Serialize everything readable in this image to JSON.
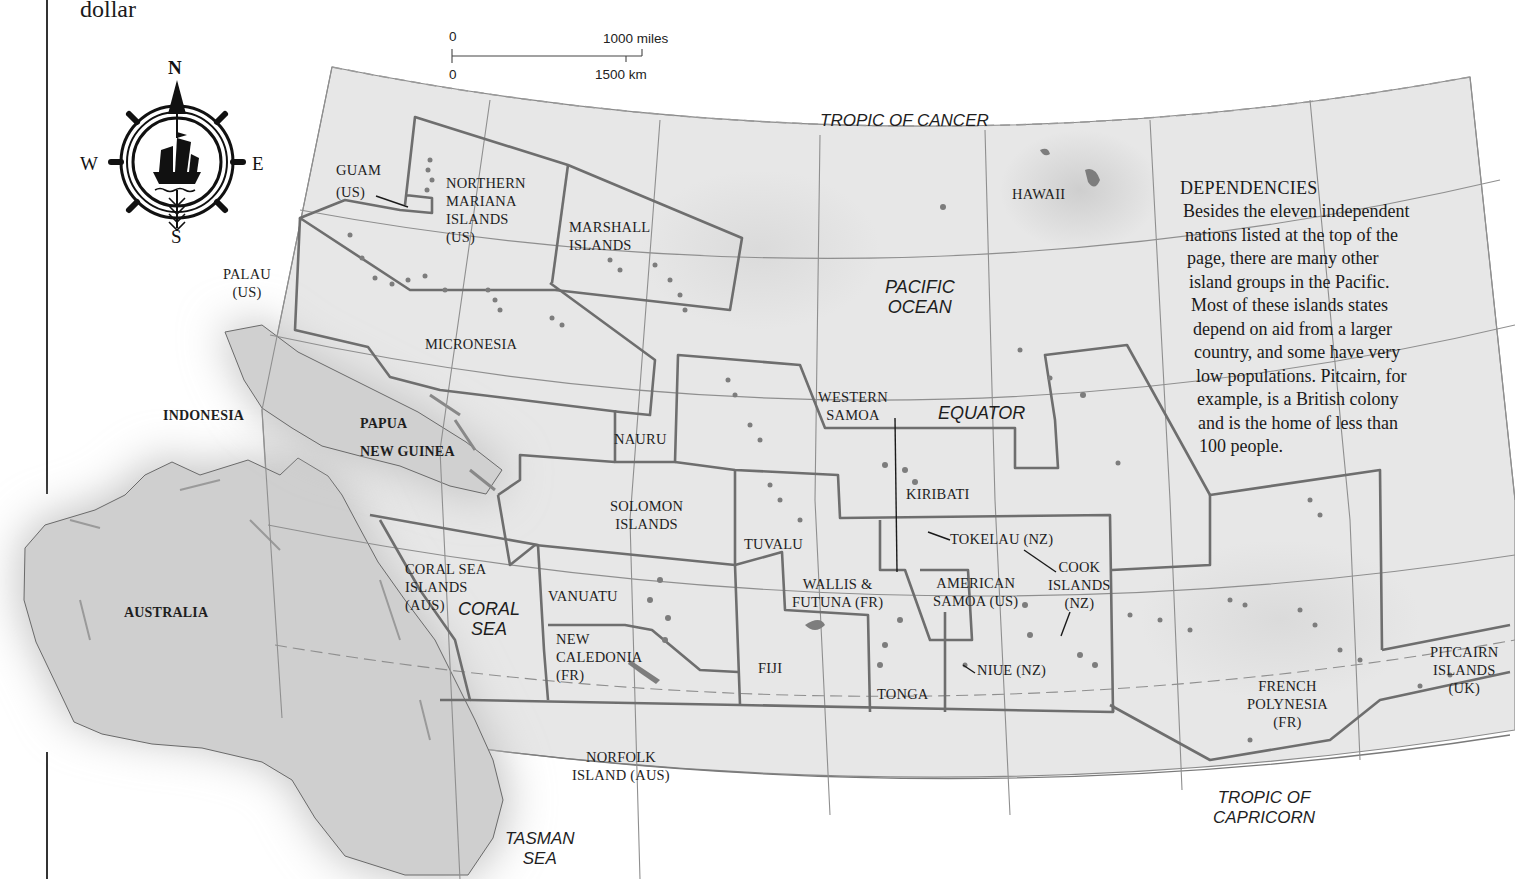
{
  "page": {
    "top_fragment": "dollar"
  },
  "scale_bar": {
    "miles_zero": "0",
    "miles_max": "1000 miles",
    "km_zero": "0",
    "km_max": "1500 km"
  },
  "compass": {
    "north": "N",
    "south": "S",
    "east": "E",
    "west": "W",
    "icon": "ship-wheel-compass-icon"
  },
  "lines_of_latitude": {
    "tropic_cancer": "TROPIC OF CANCER",
    "equator": "EQUATOR",
    "tropic_capricorn": "TROPIC OF\nCAPRICORN"
  },
  "seas": {
    "pacific": "PACIFIC\nOCEAN",
    "coral": "CORAL\nSEA",
    "tasman": "TASMAN\nSEA"
  },
  "countries": {
    "indonesia": "INDONESIA",
    "papua": "PAPUA",
    "new_guinea": "NEW GUINEA",
    "australia": "AUSTRALIA"
  },
  "territories": {
    "guam": "GUAM",
    "guam_owner": "(US)",
    "northern_mariana": "NORTHERN\nMARIANA\nISLANDS\n(US)",
    "marshall": "MARSHALL\nISLANDS",
    "palau": "PALAU\n(US)",
    "micronesia": "MICRONESIA",
    "hawaii": "HAWAII",
    "nauru": "NAURU",
    "western_samoa": "WESTERN\nSAMOA",
    "kiribati": "KIRIBATI",
    "solomon": "SOLOMON\nISLANDS",
    "tuvalu": "TUVALU",
    "tokelau": "TOKELAU (NZ)",
    "cook": "COOK\nISLANDS\n(NZ)",
    "coral_sea_islands": "CORAL SEA\nISLANDS\n(AUS)",
    "vanuatu": "VANUATU",
    "wallis_futuna": "WALLIS &\nFUTUNA (FR)",
    "american_samoa": "AMERICAN\nSAMOA (US)",
    "new_caledonia": "NEW\nCALEDONIA\n(FR)",
    "fiji": "FIJI",
    "tonga": "TONGA",
    "niue": "NIUE (NZ)",
    "french_polynesia": "FRENCH\nPOLYNESIA\n(FR)",
    "pitcairn": "PITCAIRN\nISLANDS\n(UK)",
    "norfolk": "NORFOLK\nISLAND (AUS)"
  },
  "info_box": {
    "title": "DEPENDENCIES",
    "lines": [
      "Besides the eleven independent",
      "nations listed at the top of the",
      "page, there are many other",
      "island groups in the Pacific.",
      "Most of these islands states",
      "depend on aid from a larger",
      "country, and some have very",
      "low populations. Pitcairn, for",
      "example, is a British colony",
      "and is the home of less than",
      "100 people."
    ]
  },
  "colors": {
    "map_fill": "#e6e6e6",
    "land_fill": "#c9c9c9",
    "border": "#6e6e6e",
    "graticule": "#8a8a8a"
  }
}
